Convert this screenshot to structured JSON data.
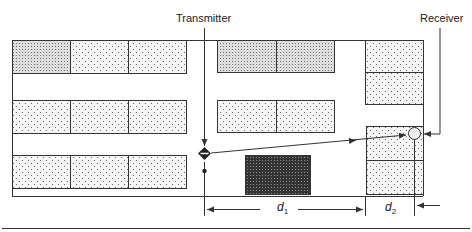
{
  "diagram": {
    "labels": {
      "transmitter": "Transmitter",
      "receiver": "Receiver",
      "d1": "d",
      "d1_sub": "1",
      "d2": "d",
      "d2_sub": "2"
    },
    "colors": {
      "line": "#333333",
      "light_fill": "#f4f4f4",
      "medium_fill": "#d6d6d6",
      "dark_fill": "#4a4a4a"
    },
    "buildings": [
      {
        "id": "left-row1-a",
        "shade": "medium"
      },
      {
        "id": "left-row1-b",
        "shade": "light"
      },
      {
        "id": "left-row1-c",
        "shade": "light"
      },
      {
        "id": "left-row2-a",
        "shade": "light"
      },
      {
        "id": "left-row2-b",
        "shade": "light"
      },
      {
        "id": "left-row2-c",
        "shade": "light"
      },
      {
        "id": "left-row3-a",
        "shade": "light"
      },
      {
        "id": "left-row3-b",
        "shade": "light"
      },
      {
        "id": "left-row3-c",
        "shade": "light"
      },
      {
        "id": "mid-row1-a",
        "shade": "medium"
      },
      {
        "id": "mid-row1-b",
        "shade": "medium"
      },
      {
        "id": "mid-row2-a",
        "shade": "light"
      },
      {
        "id": "mid-row2-b",
        "shade": "light"
      },
      {
        "id": "mid-dark-block",
        "shade": "dark"
      },
      {
        "id": "right-upper-a",
        "shade": "light"
      },
      {
        "id": "right-upper-b",
        "shade": "light"
      },
      {
        "id": "right-lower-a",
        "shade": "light"
      },
      {
        "id": "right-lower-b",
        "shade": "light"
      }
    ]
  }
}
